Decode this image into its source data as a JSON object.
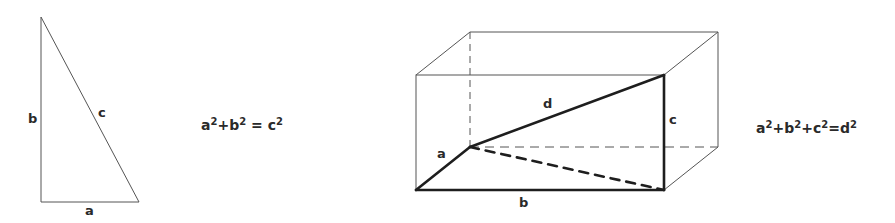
{
  "triangle": {
    "labels": {
      "a": "a",
      "b": "b",
      "c": "c"
    },
    "equation": {
      "t1": "a",
      "s1": "2",
      "t2": "+b",
      "s2": "2",
      "t3": " = c",
      "s3": "2"
    }
  },
  "box": {
    "labels": {
      "a": "a",
      "b": "b",
      "c": "c",
      "d": "d"
    },
    "equation": {
      "t1": "a",
      "s1": "2",
      "t2": "+b",
      "s2": "2",
      "t3": "+c",
      "s3": "2",
      "t4": "=d",
      "s4": "2"
    }
  },
  "colors": {
    "stroke_thin": "#555555",
    "stroke_thick": "#1e1e1e",
    "text": "#2a2a2a",
    "background": "#ffffff"
  }
}
